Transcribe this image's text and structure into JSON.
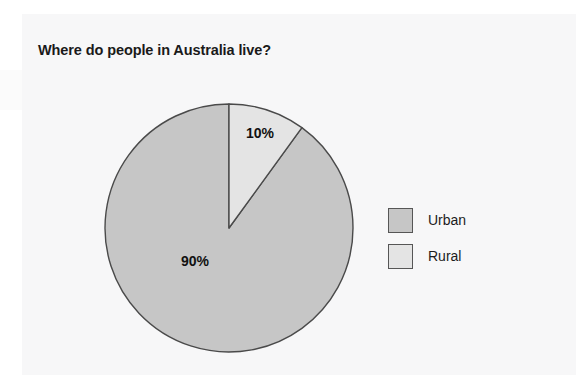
{
  "chart_data": {
    "type": "pie",
    "title": "Where do people in Australia live?",
    "categories": [
      "Urban",
      "Rural"
    ],
    "values": [
      90,
      10
    ],
    "value_labels": [
      "90%",
      "10%"
    ],
    "units": "percent",
    "total": 100,
    "start_angle_deg": 0,
    "direction": "clockwise",
    "legend_position": "right",
    "grid": false,
    "xlabel": "",
    "ylabel": "",
    "slices": [
      {
        "name": "Urban",
        "value": 90,
        "label": "90%",
        "color": "#c6c6c6",
        "start_deg": 36,
        "end_deg": 360
      },
      {
        "name": "Rural",
        "value": 10,
        "label": "10%",
        "color": "#e4e4e4",
        "start_deg": 0,
        "end_deg": 36
      }
    ]
  },
  "figure": {
    "title": "Where do people in Australia live?",
    "labels": {
      "rural_pct": "10%",
      "urban_pct": "90%"
    },
    "legend": {
      "items": [
        {
          "label": "Urban",
          "color": "#c6c6c6"
        },
        {
          "label": "Rural",
          "color": "#e4e4e4"
        }
      ]
    },
    "colors": {
      "urban": "#c6c6c6",
      "rural": "#e4e4e4",
      "outline": "#4a4a4a",
      "title_text": "#1a1a1a",
      "page": "#f7f7f8"
    }
  }
}
